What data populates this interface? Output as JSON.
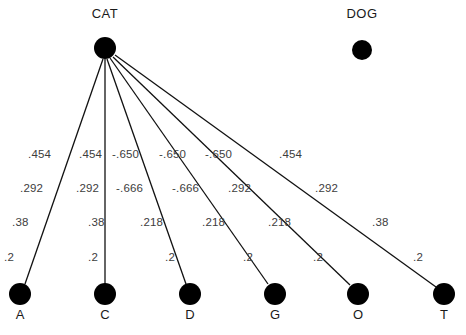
{
  "diagram": {
    "width": 466,
    "height": 335,
    "background": "#ffffff",
    "edge_color": "#111111",
    "node_color": "#000000",
    "label_color": "#3d3d3d",
    "title_color": "#1a1a1a"
  },
  "titles": [
    {
      "text": "CAT",
      "x": 105,
      "y": 6
    },
    {
      "text": "DOG",
      "x": 362,
      "y": 6
    }
  ],
  "nodes": [
    {
      "id": "cat",
      "label": "CAT",
      "x": 105,
      "y": 48,
      "r": 11,
      "caption": ""
    },
    {
      "id": "dog",
      "label": "DOG",
      "x": 362,
      "y": 50,
      "r": 10,
      "caption": ""
    },
    {
      "id": "a",
      "label": "A",
      "x": 20,
      "y": 294,
      "r": 11,
      "caption": "A"
    },
    {
      "id": "c",
      "label": "C",
      "x": 105,
      "y": 294,
      "r": 11,
      "caption": "C"
    },
    {
      "id": "d",
      "label": "D",
      "x": 190,
      "y": 294,
      "r": 11,
      "caption": "D"
    },
    {
      "id": "g",
      "label": "G",
      "x": 275,
      "y": 294,
      "r": 11,
      "caption": "G"
    },
    {
      "id": "o",
      "label": "O",
      "x": 358,
      "y": 294,
      "r": 11,
      "caption": "O"
    },
    {
      "id": "t",
      "label": "T",
      "x": 444,
      "y": 294,
      "r": 11,
      "caption": "T"
    }
  ],
  "node_captions": [
    {
      "text": "A",
      "x": 20,
      "y": 307
    },
    {
      "text": "C",
      "x": 105,
      "y": 307
    },
    {
      "text": "D",
      "x": 190,
      "y": 307
    },
    {
      "text": "G",
      "x": 275,
      "y": 307
    },
    {
      "text": "O",
      "x": 358,
      "y": 307
    },
    {
      "text": "T",
      "x": 444,
      "y": 307
    }
  ],
  "edges": [
    {
      "from": "cat",
      "to": "a",
      "x1": 103,
      "y1": 59,
      "x2": 25,
      "y2": 284
    },
    {
      "from": "cat",
      "to": "c",
      "x1": 105,
      "y1": 59,
      "x2": 105,
      "y2": 284
    },
    {
      "from": "cat",
      "to": "d",
      "x1": 107,
      "y1": 59,
      "x2": 186,
      "y2": 284
    },
    {
      "from": "cat",
      "to": "g",
      "x1": 110,
      "y1": 58,
      "x2": 268,
      "y2": 284
    },
    {
      "from": "cat",
      "to": "o",
      "x1": 113,
      "y1": 57,
      "x2": 350,
      "y2": 285
    },
    {
      "from": "cat",
      "to": "t",
      "x1": 115,
      "y1": 55,
      "x2": 436,
      "y2": 287
    }
  ],
  "edge_labels": {
    "row1": [
      {
        "text": ".454",
        "x": 28,
        "y": 148
      },
      {
        "text": ".454",
        "x": 79,
        "y": 148
      },
      {
        "text": "-.650",
        "x": 112,
        "y": 148
      },
      {
        "text": "-.650",
        "x": 159,
        "y": 148
      },
      {
        "text": "-.650",
        "x": 205,
        "y": 148
      },
      {
        "text": ".454",
        "x": 279,
        "y": 148
      }
    ],
    "row2": [
      {
        "text": ".292",
        "x": 20,
        "y": 182
      },
      {
        "text": ".292",
        "x": 76,
        "y": 182
      },
      {
        "text": "-.666",
        "x": 116,
        "y": 182
      },
      {
        "text": "-.666",
        "x": 172,
        "y": 182
      },
      {
        "text": ".292",
        "x": 228,
        "y": 182
      },
      {
        "text": ".292",
        "x": 315,
        "y": 182
      }
    ],
    "row3": [
      {
        "text": ".38",
        "x": 12,
        "y": 216
      },
      {
        "text": ".38",
        "x": 88,
        "y": 216
      },
      {
        "text": ".218",
        "x": 140,
        "y": 216
      },
      {
        "text": ".218",
        "x": 202,
        "y": 216
      },
      {
        "text": ".218",
        "x": 268,
        "y": 216
      },
      {
        "text": ".38",
        "x": 372,
        "y": 216
      }
    ],
    "row4": [
      {
        "text": ".2",
        "x": 4,
        "y": 251
      },
      {
        "text": ".2",
        "x": 88,
        "y": 251
      },
      {
        "text": ".2",
        "x": 165,
        "y": 251
      },
      {
        "text": ".2",
        "x": 243,
        "y": 251
      },
      {
        "text": ".2",
        "x": 313,
        "y": 251
      },
      {
        "text": ".2",
        "x": 413,
        "y": 251
      }
    ]
  }
}
